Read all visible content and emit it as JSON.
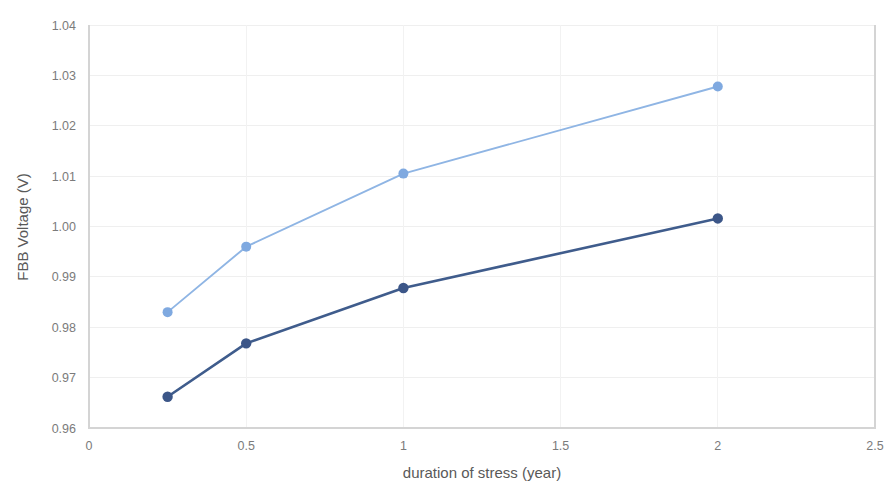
{
  "chart_data": {
    "type": "line",
    "title": "",
    "xlabel": "duration of stress (year)",
    "ylabel": "FBB Voltage (V)",
    "xlim": [
      0,
      2.5
    ],
    "ylim": [
      0.96,
      1.04
    ],
    "grid": true,
    "legend_position": "none",
    "x_ticks": [
      "0",
      "0.5",
      "1",
      "1.5",
      "2",
      "2.5"
    ],
    "x_tick_values": [
      0,
      0.5,
      1,
      1.5,
      2,
      2.5
    ],
    "y_ticks": [
      "0.96",
      "0.97",
      "0.98",
      "0.99",
      "1.00",
      "1.01",
      "1.02",
      "1.03",
      "1.04"
    ],
    "y_tick_values": [
      0.96,
      0.97,
      0.98,
      0.99,
      1.0,
      1.01,
      1.02,
      1.03,
      1.04
    ],
    "x": [
      0.25,
      0.5,
      1,
      2
    ],
    "series": [
      {
        "name": "upper-series",
        "color": "#8FB5E4",
        "marker_color": "#7FA9E0",
        "values": [
          0.983,
          0.996,
          1.0105,
          1.0278
        ]
      },
      {
        "name": "lower-series",
        "color": "#3F5C8C",
        "marker_color": "#3C5688",
        "values": [
          0.9662,
          0.9768,
          0.9878,
          1.0016
        ]
      }
    ]
  },
  "colors": {
    "upper_series": "#8FB5E4",
    "lower_series": "#3F5C8C",
    "gridline": "#efefef",
    "axis": "#d4d4d4",
    "tick_text": "#7b7b7b",
    "axis_title_text": "#595959",
    "background": "#ffffff"
  }
}
